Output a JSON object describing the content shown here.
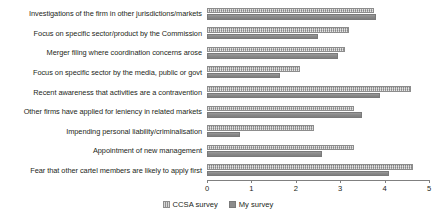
{
  "chart_data": {
    "type": "bar",
    "orientation": "horizontal",
    "title": "",
    "xlabel": "",
    "ylabel": "",
    "xlim": [
      0,
      5
    ],
    "xticks": [
      "0",
      "1",
      "2",
      "3",
      "4",
      "5"
    ],
    "grid": false,
    "legend_position": "bottom",
    "categories": [
      "Investigations of the firm in other jurisdictions/markets",
      "Focus on specific sector/product by the Commission",
      "Merger filing where coordination concerns arose",
      "Focus on specific sector by the media, public or govt",
      "Recent awareness that activities are a contravention",
      "Other firms have applied for leniency in related markets",
      "Impending personal liability/criminalisation",
      "Appointment of new management",
      "Fear that other cartel members are likely to apply first"
    ],
    "series": [
      {
        "name": "CCSA survey",
        "color": "#a8a8a8",
        "values": [
          3.75,
          3.2,
          3.1,
          2.1,
          4.6,
          3.3,
          2.4,
          3.3,
          4.65
        ]
      },
      {
        "name": "My survey",
        "color": "#8c8c8c",
        "values": [
          3.8,
          2.5,
          2.95,
          1.65,
          3.9,
          3.5,
          0.75,
          2.6,
          4.1
        ]
      }
    ]
  },
  "legend": {
    "items": [
      {
        "label": "CCSA survey"
      },
      {
        "label": "My survey"
      }
    ]
  }
}
